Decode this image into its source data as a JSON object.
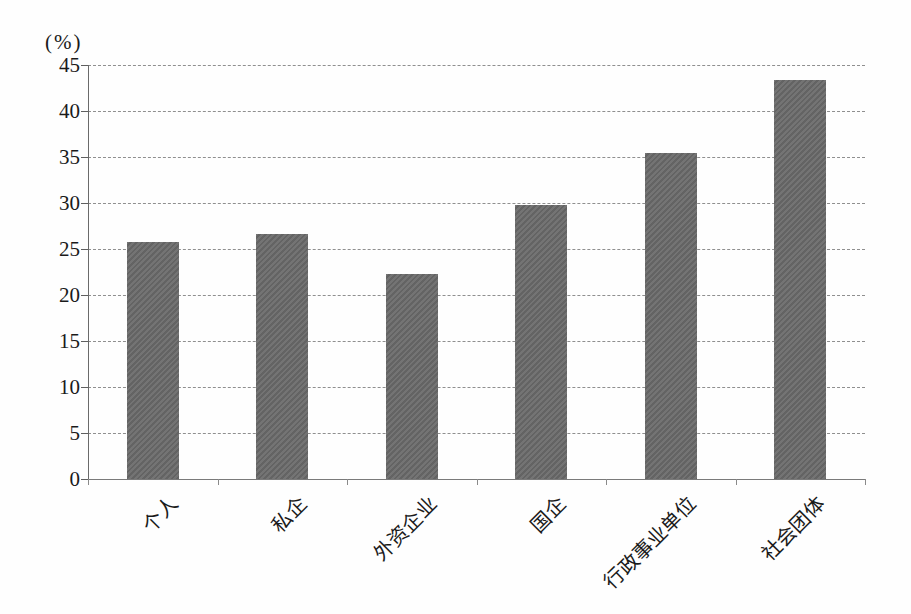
{
  "figure": {
    "unit_label": "(%)"
  },
  "chart_data": {
    "type": "bar",
    "categories": [
      "个人",
      "私企",
      "外资企业",
      "国企",
      "行政事业单位",
      "社会团体"
    ],
    "values": [
      25.8,
      26.6,
      22.3,
      29.8,
      35.4,
      43.4
    ],
    "title": "",
    "xlabel": "",
    "ylabel": "(%)",
    "ylim": [
      0,
      45
    ],
    "yticks": [
      0,
      5,
      10,
      15,
      20,
      25,
      30,
      35,
      40,
      45
    ],
    "grid": "horizontal-dashed",
    "legend": "none",
    "colors": {
      "bar": "#6b6b6b",
      "gridline": "#8f8f8f",
      "axis": "#6a6a6a",
      "text": "#1a1a1a",
      "background": "#fefefe"
    }
  }
}
